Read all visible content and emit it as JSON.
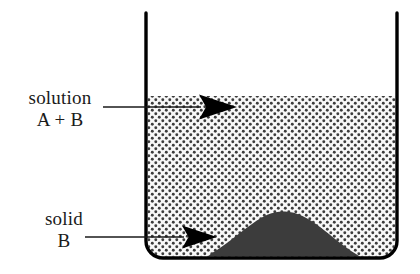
{
  "figure": {
    "background_color": "#ffffff",
    "width": 420,
    "height": 274
  },
  "labels": {
    "solution": {
      "line1": "solution",
      "line2": "A + B",
      "points_to": "stippled-solution-region"
    },
    "solid": {
      "line1": "solid",
      "line2": "B",
      "points_to": "solid-mound-region"
    }
  },
  "beaker": {
    "name": "beaker",
    "wall_color": "#000000",
    "wall_thickness": 3.2,
    "left_wall_x": 146,
    "right_wall_x": 397,
    "rim_y": 13,
    "floor_y": 258,
    "corner_radius": 16,
    "interior_fill": "#ffffff"
  },
  "solution_region": {
    "name": "solution",
    "composition": "A + B",
    "surface_y": 96,
    "pattern": "stipple-dots",
    "dot_color": "#3a3a3a",
    "dot_spacing": 7,
    "dot_radius": 1.5,
    "background_color": "#f7f7f7"
  },
  "solid_region": {
    "name": "solid B",
    "substance": "B",
    "fill_color": "#3c3c3c",
    "shape": "mound",
    "left_base_x": 212,
    "right_base_x": 360,
    "peak_x": 283,
    "peak_y": 212,
    "base_y": 256
  },
  "leaders": {
    "solution_leader": {
      "line_color": "#1a1a1a",
      "line_width": 1.6,
      "x_start": 103,
      "x_end": 200,
      "y": 107,
      "arrow_tip_x": 237,
      "arrow_back_x": 199,
      "arrow_half_height": 13
    },
    "solid_leader": {
      "line_color": "#1a1a1a",
      "line_width": 1.6,
      "x_start": 85,
      "x_end": 183,
      "y": 237,
      "arrow_tip_x": 217,
      "arrow_back_x": 182,
      "arrow_half_height": 12
    },
    "arrow_color": "#000000"
  }
}
